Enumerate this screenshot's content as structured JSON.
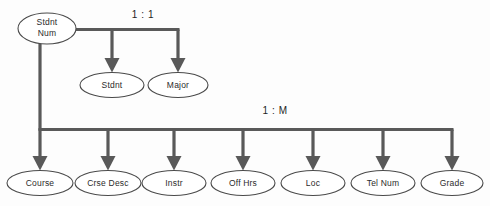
{
  "diagram": {
    "type": "hierarchical-data-structure-diagram",
    "colors": {
      "background": "#fdfdfd",
      "connector": "#595959",
      "node_stroke": "#4a4a4a",
      "node_fill": "#ffffff",
      "text": "#2b2b2b"
    },
    "root_node": {
      "id": "stdnt-num",
      "label_line1": "Stdnt",
      "label_line2": "Num"
    },
    "relationships": [
      {
        "id": "one-to-one",
        "label": "1 : 1"
      },
      {
        "id": "one-to-many",
        "label": "1 : M"
      }
    ],
    "one_to_one_nodes": [
      {
        "id": "stdnt",
        "label": "Stdnt"
      },
      {
        "id": "major",
        "label": "Major"
      }
    ],
    "one_to_many_nodes": [
      {
        "id": "course",
        "label": "Course"
      },
      {
        "id": "crse-desc",
        "label": "Crse Desc"
      },
      {
        "id": "instr",
        "label": "Instr"
      },
      {
        "id": "off-hrs",
        "label": "Off Hrs"
      },
      {
        "id": "loc",
        "label": "Loc"
      },
      {
        "id": "tel-num",
        "label": "Tel Num"
      },
      {
        "id": "grade",
        "label": "Grade"
      }
    ]
  }
}
